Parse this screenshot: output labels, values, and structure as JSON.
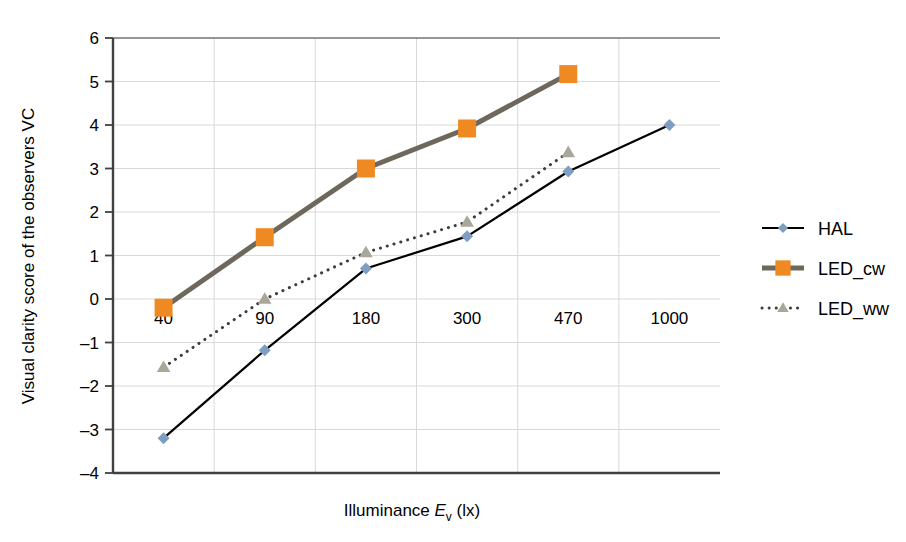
{
  "chart_data": {
    "type": "line",
    "title": "",
    "xlabel": "Illuminance E_v (lx)",
    "xlabel_main": "Illuminance ",
    "xlabel_italic": "E",
    "xlabel_sub": "v",
    "xlabel_unit": " (lx)",
    "ylabel": "Visual clarity score of the observers VC",
    "categories": [
      "40",
      "90",
      "180",
      "300",
      "470",
      "1000"
    ],
    "x_tick_labels": [
      "40",
      "90",
      "180",
      "300",
      "470",
      "1000"
    ],
    "y_tick_labels": [
      "6",
      "5",
      "4",
      "3",
      "2",
      "1",
      "0",
      "-1",
      "-2",
      "-3",
      "-4"
    ],
    "ylim": [
      -4,
      6
    ],
    "y_major_step": 1,
    "grid": "both",
    "legend_position": "right",
    "series": [
      {
        "name": "HAL",
        "marker": "diamond",
        "marker_color": "#7e9ec4",
        "line_color": "#000000",
        "line_style": "solid",
        "line_width": 2.2,
        "values": [
          -3.2,
          -1.18,
          0.7,
          1.44,
          2.93,
          4.0
        ]
      },
      {
        "name": "LED_cw",
        "marker": "square",
        "marker_color": "#ef8a22",
        "line_color": "#6e675c",
        "line_style": "solid",
        "line_width": 5,
        "values": [
          -0.2,
          1.42,
          3.0,
          3.92,
          5.17,
          null
        ]
      },
      {
        "name": "LED_ww",
        "marker": "triangle",
        "marker_color": "#a9a69a",
        "line_color": "#3c3c3c",
        "line_style": "dotted",
        "line_width": 3,
        "values": [
          -1.57,
          0.0,
          1.07,
          1.77,
          3.37,
          null
        ]
      }
    ]
  },
  "legend": {
    "items": [
      {
        "label": "HAL"
      },
      {
        "label": "LED_cw"
      },
      {
        "label": "LED_ww"
      }
    ]
  },
  "colors": {
    "hal_marker": "#7e9ec4",
    "hal_line": "#000000",
    "ledcw_marker": "#ef8a22",
    "ledcw_line": "#6e675c",
    "ledww_marker": "#a9a69a",
    "ledww_line": "#3c3c3c",
    "grid": "#d9d9d9",
    "axis": "#404040"
  }
}
